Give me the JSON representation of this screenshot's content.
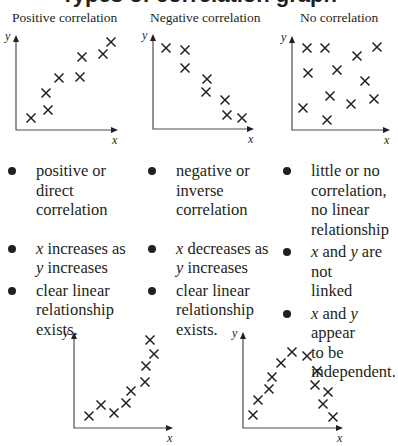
{
  "title": "Types of correlation graph",
  "columns": [
    {
      "heading": "Positive correlation",
      "bullets": [
        {
          "text": "positive or direct correlation",
          "lines": [
            "positive or",
            "direct",
            "correlation"
          ]
        },
        {
          "text": "x increases as y increases",
          "lines": [
            "x increases as",
            "y increases"
          ]
        },
        {
          "text": "clear linear relationship exists.",
          "lines": [
            "clear linear",
            "relationship",
            "exists."
          ]
        }
      ]
    },
    {
      "heading": "Negative correlation",
      "bullets": [
        {
          "text": "negative or inverse correlation",
          "lines": [
            "negative or",
            "inverse",
            "correlation"
          ]
        },
        {
          "text": "x decreases as y increases",
          "lines": [
            "x decreases as",
            "y increases"
          ]
        },
        {
          "text": "clear linear relationship exists.",
          "lines": [
            "clear linear",
            "relationship",
            "exists."
          ]
        }
      ]
    },
    {
      "heading": "No correlation",
      "bullets": [
        {
          "text": "little or no correlation, no linear relationship",
          "lines": [
            "little or no",
            "correlation,",
            "no linear",
            "relationship"
          ]
        },
        {
          "text": "x and y are not linked",
          "lines": [
            "x and y are not",
            "linked"
          ]
        },
        {
          "text": "x and y appear to be independent.",
          "lines": [
            "x and y appear",
            "to be",
            "independent."
          ]
        }
      ]
    }
  ],
  "axis_labels": {
    "x": "x",
    "y": "y"
  },
  "chart_data": [
    {
      "type": "scatter",
      "title": "Positive correlation",
      "xlabel": "x",
      "ylabel": "y",
      "axes": {
        "ox": 16,
        "oy": 130,
        "top": 36,
        "right": 117
      },
      "points": [
        [
          31,
          118
        ],
        [
          48,
          110
        ],
        [
          46,
          93
        ],
        [
          59,
          78
        ],
        [
          80,
          77
        ],
        [
          82,
          57
        ],
        [
          103,
          54
        ],
        [
          111,
          42
        ]
      ]
    },
    {
      "type": "scatter",
      "title": "Negative correlation",
      "xlabel": "x",
      "ylabel": "y",
      "axes": {
        "ox": 153,
        "oy": 129,
        "top": 35,
        "right": 253
      },
      "points": [
        [
          166,
          48
        ],
        [
          185,
          50
        ],
        [
          185,
          68
        ],
        [
          207,
          79
        ],
        [
          206,
          92
        ],
        [
          225,
          100
        ],
        [
          227,
          115
        ],
        [
          242,
          118
        ]
      ]
    },
    {
      "type": "scatter",
      "title": "No correlation",
      "xlabel": "x",
      "ylabel": "y",
      "axes": {
        "ox": 292,
        "oy": 130,
        "top": 37,
        "right": 389
      },
      "points": [
        [
          307,
          48
        ],
        [
          325,
          48
        ],
        [
          357,
          56
        ],
        [
          377,
          47
        ],
        [
          308,
          73
        ],
        [
          337,
          70
        ],
        [
          365,
          81
        ],
        [
          330,
          96
        ],
        [
          303,
          108
        ],
        [
          351,
          104
        ],
        [
          374,
          99
        ],
        [
          327,
          120
        ]
      ]
    },
    {
      "type": "scatter",
      "title": "Non-linear (exponential-like) relationship",
      "xlabel": "x",
      "ylabel": "y",
      "axes": {
        "ox": 74,
        "oy": 428,
        "top": 333,
        "right": 172
      },
      "points": [
        [
          89,
          416
        ],
        [
          101,
          405
        ],
        [
          114,
          413
        ],
        [
          126,
          403
        ],
        [
          131,
          391
        ],
        [
          145,
          382
        ],
        [
          146,
          366
        ],
        [
          154,
          354
        ],
        [
          150,
          340
        ]
      ]
    },
    {
      "type": "scatter",
      "title": "Non-linear (parabolic) relationship",
      "xlabel": "x",
      "ylabel": "y",
      "axes": {
        "ox": 243,
        "oy": 428,
        "top": 333,
        "right": 342
      },
      "points": [
        [
          253,
          415
        ],
        [
          258,
          400
        ],
        [
          269,
          389
        ],
        [
          272,
          377
        ],
        [
          281,
          363
        ],
        [
          292,
          352
        ],
        [
          307,
          356
        ],
        [
          317,
          371
        ],
        [
          315,
          385
        ],
        [
          328,
          392
        ],
        [
          323,
          404
        ],
        [
          333,
          417
        ]
      ]
    }
  ]
}
